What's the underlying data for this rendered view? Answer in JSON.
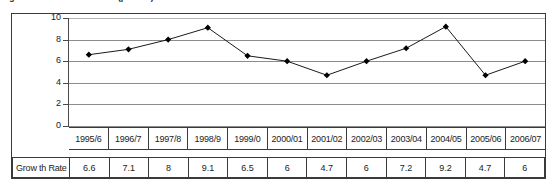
{
  "figure": {
    "title": "Figure 3.1: GDP Growth Rate (percent)",
    "row_label": "Grow th Rate"
  },
  "colors": {
    "line": "#1a1a1a",
    "marker": "#000000",
    "gridline": "#8c8c8c",
    "axis": "#4a4a4a",
    "border": "#3a3a3a",
    "background": "#ffffff"
  },
  "chart_data": {
    "type": "line",
    "title": "Figure 3.1: GDP Growth Rate (percent)",
    "xlabel": "",
    "ylabel": "",
    "ylim": [
      0,
      10
    ],
    "yticks": [
      0,
      2,
      4,
      6,
      8,
      10
    ],
    "grid": true,
    "legend": false,
    "marker": "diamond",
    "categories": [
      "1995/6",
      "1996/7",
      "1997/8",
      "1998/9",
      "1999/0",
      "2000/01",
      "2001/02",
      "2002/03",
      "2003/04",
      "2004/05",
      "2005/06",
      "2006/07"
    ],
    "values": [
      6.6,
      7.1,
      8,
      9.1,
      6.5,
      6,
      4.7,
      6,
      7.2,
      9.2,
      4.7,
      6
    ],
    "value_labels": [
      "6.6",
      "7.1",
      "8",
      "9.1",
      "6.5",
      "6",
      "4.7",
      "6",
      "7.2",
      "9.2",
      "4.7",
      "6"
    ],
    "series": [
      {
        "name": "Grow th Rate",
        "values": [
          6.6,
          7.1,
          8,
          9.1,
          6.5,
          6,
          4.7,
          6,
          7.2,
          9.2,
          4.7,
          6
        ]
      }
    ]
  }
}
